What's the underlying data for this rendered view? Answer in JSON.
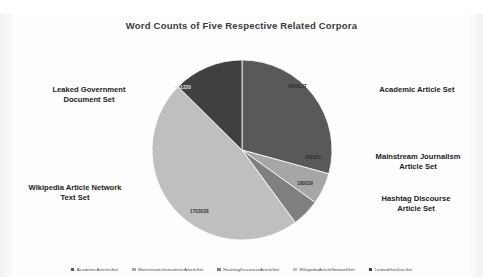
{
  "chart_data": {
    "type": "pie",
    "title": "Word Counts of Five Respective Related Corpora",
    "categories": [
      "AcademicArticlesSet",
      "MainstreamJournalisticArticleSet",
      "HashtagDiscourseArticleSet",
      "WikipediaArticleNetworkSet",
      "LeakedGovDocSet"
    ],
    "values": [
      1049127,
      202352,
      180039,
      1703038,
      451220
    ],
    "value_labels": [
      "1049127",
      "202352",
      "180039",
      "1703038",
      "451220"
    ],
    "colors": [
      "#595959",
      "#a6a6a6",
      "#808080",
      "#bfbfbf",
      "#404040"
    ],
    "legend_position": "bottom",
    "grid": false,
    "xlabel": "",
    "ylabel": ""
  },
  "callouts": {
    "academic": "Academic Article Set",
    "mainstream": "Mainstream Journalism\nArticle Set",
    "hashtag": "Hashtag Discourse\nArticle Set",
    "wikipedia": "Wikipedia Article Network\nText Set",
    "leaked": "Leaked Government\nDocument Set"
  },
  "legend": [
    {
      "label": "AcademicArticlesSet",
      "color": "#595959"
    },
    {
      "label": "MainstreamJournalisticArticleSet",
      "color": "#a6a6a6"
    },
    {
      "label": "HashtagDiscourseArticleSet",
      "color": "#808080"
    },
    {
      "label": "WikipediaArticleNetworkSet",
      "color": "#bfbfbf"
    },
    {
      "label": "LeakedGovDocSet",
      "color": "#404040"
    }
  ]
}
